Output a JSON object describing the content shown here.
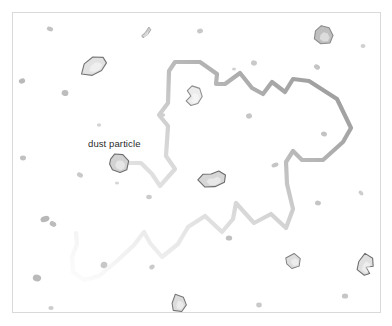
{
  "figure": {
    "background_color": "#ffffff",
    "frame_border_color": "#d9d9d9",
    "width": 392,
    "height": 326
  },
  "annotations": [
    {
      "id": "dust-particle-label",
      "text": "dust particle",
      "x": 88,
      "y": 138,
      "color": "#2b2b2b",
      "font_size": 9.5
    }
  ],
  "trajectory": {
    "name": "brownian-path",
    "description": "Random-walk trajectory of the tracked dust particle, fading from opaque recent segments to transparent older segments",
    "stroke_width": 4.2,
    "stroke_color_recent": "#9a9a9a",
    "stroke_color_old": "#fbfbfb",
    "gradient_direction": "dark at upper-right, fading toward lower-left",
    "linejoin": "round",
    "linecap": "round",
    "points": [
      [
        124,
        163
      ],
      [
        141,
        163
      ],
      [
        152,
        174
      ],
      [
        160,
        186
      ],
      [
        175,
        169
      ],
      [
        166,
        156
      ],
      [
        168,
        126
      ],
      [
        159,
        115
      ],
      [
        168,
        103
      ],
      [
        169,
        71
      ],
      [
        175,
        62
      ],
      [
        200,
        62
      ],
      [
        217,
        74
      ],
      [
        216,
        84
      ],
      [
        225,
        84
      ],
      [
        240,
        73
      ],
      [
        252,
        88
      ],
      [
        263,
        94
      ],
      [
        272,
        82
      ],
      [
        285,
        92
      ],
      [
        293,
        79
      ],
      [
        309,
        81
      ],
      [
        337,
        99
      ],
      [
        351,
        128
      ],
      [
        343,
        142
      ],
      [
        323,
        160
      ],
      [
        302,
        160
      ],
      [
        293,
        151
      ],
      [
        286,
        162
      ],
      [
        287,
        184
      ],
      [
        293,
        209
      ],
      [
        286,
        228
      ],
      [
        271,
        214
      ],
      [
        254,
        223
      ],
      [
        236,
        203
      ],
      [
        233,
        219
      ],
      [
        222,
        232
      ],
      [
        205,
        216
      ],
      [
        188,
        227
      ],
      [
        178,
        244
      ],
      [
        162,
        257
      ],
      [
        150,
        243
      ],
      [
        144,
        232
      ],
      [
        134,
        245
      ],
      [
        118,
        260
      ],
      [
        99,
        276
      ],
      [
        84,
        280
      ],
      [
        73,
        272
      ],
      [
        72,
        257
      ],
      [
        77,
        244
      ],
      [
        76,
        233
      ]
    ]
  },
  "particles": {
    "description": "Suspended dust particles and fine fragments in the medium",
    "large": [
      {
        "name": "dust-particle-tracked",
        "cx": 119,
        "cy": 163,
        "scale": 1.0,
        "rotate": 12,
        "fill": "#d2d2d2",
        "stroke": "#6e6e6e",
        "shape": "M -9 -2 L -6 -8 L 2 -9 L 9 -4 L 9 5 L 3 9 L -5 8 L -9 3 Z"
      },
      {
        "name": "dust-particle-upper-left",
        "cx": 93,
        "cy": 66,
        "scale": 1.05,
        "rotate": -22,
        "fill": "#e2e2e2",
        "stroke": "#767676",
        "shape": "M -13 3 L -7 -5 L 3 -8 L 12 -4 L 13 2 L 6 7 L -4 8 Z"
      },
      {
        "name": "dust-particle-top-right",
        "cx": 323,
        "cy": 35,
        "scale": 1.0,
        "rotate": 8,
        "fill": "#bfbfbf",
        "stroke": "#8a8a8a",
        "shape": "M -8 -3 L -3 -9 L 5 -8 L 10 -1 L 8 7 L -1 9 L -8 5 Z"
      },
      {
        "name": "dust-particle-inner-loop",
        "cx": 194,
        "cy": 96,
        "scale": 1.0,
        "rotate": 18,
        "fill": "#ececec",
        "stroke": "#8f8f8f",
        "shape": "M -5 -9 L 3 -9 L 8 -2 L 6 6 L 0 10 L -6 7 L -3 1 L -8 -3 Z"
      },
      {
        "name": "dust-particle-center-pair",
        "cx": 212,
        "cy": 180,
        "scale": 1.0,
        "rotate": -8,
        "fill": "#d6d6d6",
        "stroke": "#6b6b6b",
        "shape": "M -14 -2 L -8 -7 L 0 -6 L 8 -8 L 14 -3 L 12 4 L 2 7 L -8 6 Z"
      },
      {
        "name": "dust-particle-bottom-center",
        "cx": 179,
        "cy": 303,
        "scale": 0.95,
        "rotate": 14,
        "fill": "#dcdcdc",
        "stroke": "#767676",
        "shape": "M -6 -8 L 3 -7 L 8 0 L 5 8 L -4 9 L -7 2 Z"
      },
      {
        "name": "dust-particle-lower-right",
        "cx": 293,
        "cy": 261,
        "scale": 0.85,
        "rotate": -18,
        "fill": "#dedede",
        "stroke": "#7d7d7d",
        "shape": "M -7 -6 L 4 -8 L 9 0 L 5 8 L -4 8 L -8 1 Z"
      },
      {
        "name": "dust-particle-right-edge",
        "cx": 366,
        "cy": 265,
        "scale": 1.0,
        "rotate": 26,
        "fill": "#e0e0e0",
        "stroke": "#6f6f6f",
        "shape": "M -6 -10 L 3 -9 L 7 -2 L 1 2 L 7 6 L 3 10 L -6 8 L -8 0 Z"
      },
      {
        "name": "dust-particle-sliver-top",
        "cx": 146,
        "cy": 33,
        "scale": 0.8,
        "rotate": 40,
        "fill": "#cfcfcf",
        "stroke": "#a6a6a6",
        "shape": "M -2 -8 L 2 -7 L 3 0 L 1 7 L -2 6 L -1 0 Z"
      }
    ],
    "small": [
      {
        "cx": 50,
        "cy": 29,
        "rx": 3.2,
        "ry": 2.2,
        "rot": 20,
        "fill": "#c2c2c2"
      },
      {
        "cx": 200,
        "cy": 31,
        "rx": 3.0,
        "ry": 2.4,
        "rot": -15,
        "fill": "#c8c8c8"
      },
      {
        "cx": 254,
        "cy": 63,
        "rx": 3.0,
        "ry": 2.6,
        "rot": 10,
        "fill": "#c9c9c9"
      },
      {
        "cx": 317,
        "cy": 67,
        "rx": 3.2,
        "ry": 2.4,
        "rot": 35,
        "fill": "#c4c4c4"
      },
      {
        "cx": 363,
        "cy": 46,
        "rx": 2.4,
        "ry": 1.9,
        "rot": 0,
        "fill": "#d0d0d0"
      },
      {
        "cx": 22,
        "cy": 81,
        "rx": 3.2,
        "ry": 2.6,
        "rot": -25,
        "fill": "#b9b9b9"
      },
      {
        "cx": 65,
        "cy": 93,
        "rx": 3.4,
        "ry": 3.0,
        "rot": 15,
        "fill": "#bdbdbd"
      },
      {
        "cx": 99,
        "cy": 125,
        "rx": 2.2,
        "ry": 1.8,
        "rot": 0,
        "fill": "#d4d4d4"
      },
      {
        "cx": 163,
        "cy": 115,
        "rx": 2.2,
        "ry": 1.7,
        "rot": 0,
        "fill": "#cfcfcf"
      },
      {
        "cx": 249,
        "cy": 116,
        "rx": 3.0,
        "ry": 2.6,
        "rot": -10,
        "fill": "#c6c6c6"
      },
      {
        "cx": 324,
        "cy": 134,
        "rx": 3.0,
        "ry": 2.4,
        "rot": 18,
        "fill": "#c3c3c3"
      },
      {
        "cx": 23,
        "cy": 158,
        "rx": 3.0,
        "ry": 2.4,
        "rot": 0,
        "fill": "#c1c1c1"
      },
      {
        "cx": 80,
        "cy": 175,
        "rx": 3.2,
        "ry": 2.2,
        "rot": 30,
        "fill": "#c9c9c9"
      },
      {
        "cx": 275,
        "cy": 165,
        "rx": 3.6,
        "ry": 2.2,
        "rot": -20,
        "fill": "#c5c5c5"
      },
      {
        "cx": 149,
        "cy": 197,
        "rx": 2.8,
        "ry": 2.2,
        "rot": 0,
        "fill": "#cbcbcb"
      },
      {
        "cx": 318,
        "cy": 203,
        "rx": 3.0,
        "ry": 2.4,
        "rot": 12,
        "fill": "#c4c4c4"
      },
      {
        "cx": 361,
        "cy": 193,
        "rx": 2.8,
        "ry": 1.8,
        "rot": 40,
        "fill": "#cdcdcd"
      },
      {
        "cx": 45,
        "cy": 219,
        "rx": 4.6,
        "ry": 3.0,
        "rot": -18,
        "fill": "#b8b8b8"
      },
      {
        "cx": 53,
        "cy": 224,
        "rx": 3.4,
        "ry": 2.6,
        "rot": 25,
        "fill": "#bcbcbc"
      },
      {
        "cx": 229,
        "cy": 238,
        "rx": 3.2,
        "ry": 2.6,
        "rot": 0,
        "fill": "#c0c0c0"
      },
      {
        "cx": 104,
        "cy": 265,
        "rx": 3.4,
        "ry": 3.2,
        "rot": 10,
        "fill": "#c7c7c7"
      },
      {
        "cx": 152,
        "cy": 267,
        "rx": 2.8,
        "ry": 2.2,
        "rot": -30,
        "fill": "#cacaca"
      },
      {
        "cx": 37,
        "cy": 278,
        "rx": 4.2,
        "ry": 3.4,
        "rot": 15,
        "fill": "#bababa"
      },
      {
        "cx": 345,
        "cy": 296,
        "rx": 3.2,
        "ry": 2.6,
        "rot": 0,
        "fill": "#c6c6c6"
      },
      {
        "cx": 259,
        "cy": 305,
        "rx": 2.8,
        "ry": 2.4,
        "rot": 0,
        "fill": "#c9c9c9"
      },
      {
        "cx": 51,
        "cy": 308,
        "rx": 2.6,
        "ry": 2.0,
        "rot": 0,
        "fill": "#cccccc"
      },
      {
        "cx": 234,
        "cy": 69,
        "rx": 2.0,
        "ry": 1.6,
        "rot": 0,
        "fill": "#d2d2d2"
      },
      {
        "cx": 117,
        "cy": 183,
        "rx": 2.0,
        "ry": 1.6,
        "rot": 0,
        "fill": "#d5d5d5"
      }
    ]
  }
}
